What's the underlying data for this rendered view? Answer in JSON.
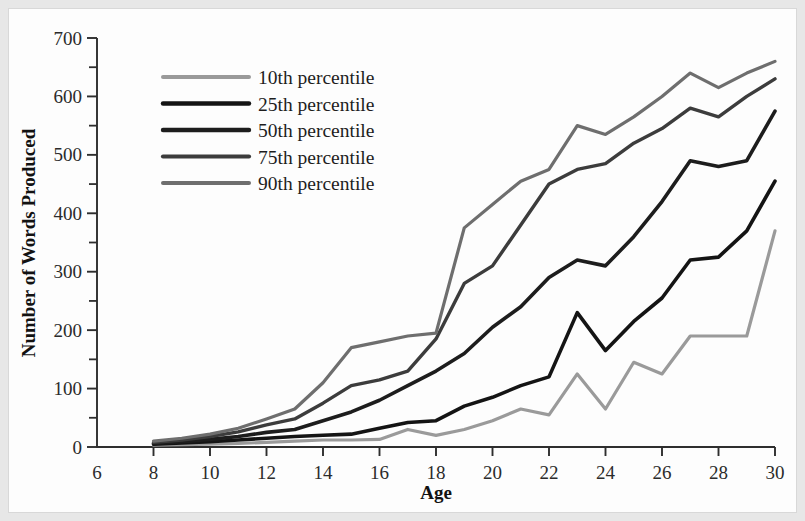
{
  "figure": {
    "background_color": "#fdfdfd",
    "border_color": "#e2e2e2"
  },
  "axes": {
    "x_title": "Age",
    "y_title": "Number of Words Produced",
    "x_ticks": [
      "6",
      "8",
      "10",
      "12",
      "14",
      "16",
      "18",
      "20",
      "22",
      "24",
      "26",
      "28",
      "30"
    ],
    "y_ticks": [
      "0",
      "100",
      "200",
      "300",
      "400",
      "500",
      "600",
      "700"
    ]
  },
  "legend": {
    "items": [
      {
        "label": "10th percentile",
        "color": "#9a9a9a",
        "width": 3.2
      },
      {
        "label": "25th percentile",
        "color": "#141414",
        "width": 3.6
      },
      {
        "label": "50th percentile",
        "color": "#1d1d1d",
        "width": 3.6
      },
      {
        "label": "75th percentile",
        "color": "#3c3c3c",
        "width": 3.4
      },
      {
        "label": "90th percentile",
        "color": "#6e6e6e",
        "width": 3.2
      }
    ]
  },
  "chart_data": {
    "type": "line",
    "title": "",
    "xlabel": "Age",
    "ylabel": "Number of Words Produced",
    "xlim": [
      6,
      30
    ],
    "ylim": [
      0,
      700
    ],
    "grid": false,
    "legend_position": "upper-left-inside",
    "x": [
      8,
      9,
      10,
      11,
      12,
      13,
      14,
      15,
      16,
      17,
      18,
      19,
      20,
      21,
      22,
      23,
      24,
      25,
      26,
      27,
      28,
      29,
      30
    ],
    "series": [
      {
        "name": "10th percentile",
        "color": "#9a9a9a",
        "values": [
          3,
          4,
          5,
          6,
          8,
          10,
          12,
          12,
          13,
          30,
          20,
          30,
          45,
          65,
          55,
          125,
          65,
          145,
          125,
          190,
          190,
          190,
          370
        ]
      },
      {
        "name": "25th percentile",
        "color": "#141414",
        "values": [
          5,
          7,
          9,
          12,
          15,
          18,
          20,
          22,
          32,
          42,
          45,
          70,
          85,
          105,
          120,
          230,
          165,
          215,
          255,
          320,
          325,
          370,
          455
        ]
      },
      {
        "name": "50th percentile",
        "color": "#1d1d1d",
        "values": [
          6,
          9,
          13,
          18,
          25,
          30,
          45,
          60,
          80,
          105,
          130,
          160,
          205,
          240,
          290,
          320,
          310,
          360,
          420,
          490,
          480,
          490,
          575
        ]
      },
      {
        "name": "75th percentile",
        "color": "#3c3c3c",
        "values": [
          8,
          12,
          18,
          26,
          38,
          48,
          75,
          105,
          115,
          130,
          185,
          280,
          310,
          380,
          450,
          475,
          485,
          520,
          545,
          580,
          565,
          600,
          630
        ]
      },
      {
        "name": "90th percentile",
        "color": "#6e6e6e",
        "values": [
          10,
          15,
          22,
          32,
          48,
          65,
          110,
          170,
          180,
          190,
          195,
          375,
          415,
          455,
          475,
          550,
          535,
          565,
          600,
          640,
          615,
          640,
          660
        ]
      }
    ]
  }
}
